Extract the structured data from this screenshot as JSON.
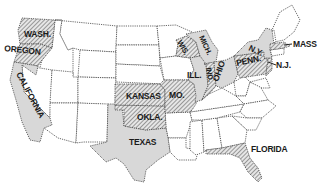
{
  "map": {
    "title": "",
    "legend_styles": {
      "gray": "#d8d8d8",
      "hatch": "diagonal-lines",
      "plain": "#ffffff"
    },
    "labels": {
      "wash": "WASH.",
      "oregon": "OREGON",
      "california": "CALIFORNIA",
      "kansas": "KANSAS",
      "mo": "MO.",
      "okla": "OKLA.",
      "texas": "TEXAS",
      "wis": "WIS.",
      "mich": "MICH.",
      "ill": "ILL.",
      "ind": "IND.",
      "ohio": "OHIO",
      "ny": "N.Y.",
      "penn": "PENN.",
      "mass": "MASS",
      "nj": "N.J.",
      "florida": "FLORIDA"
    },
    "highlighted_states": [
      {
        "name": "Washington",
        "style": "hatch"
      },
      {
        "name": "Oregon",
        "style": "hatch"
      },
      {
        "name": "California",
        "style": "gray"
      },
      {
        "name": "Kansas",
        "style": "hatch"
      },
      {
        "name": "Missouri",
        "style": "hatch"
      },
      {
        "name": "Oklahoma",
        "style": "hatch"
      },
      {
        "name": "Texas",
        "style": "gray"
      },
      {
        "name": "Wisconsin",
        "style": "hatch"
      },
      {
        "name": "Michigan",
        "style": "gray"
      },
      {
        "name": "Illinois",
        "style": "gray"
      },
      {
        "name": "Indiana",
        "style": "hatch"
      },
      {
        "name": "Ohio",
        "style": "gray"
      },
      {
        "name": "New York",
        "style": "gray"
      },
      {
        "name": "Pennsylvania",
        "style": "hatch"
      },
      {
        "name": "Massachusetts",
        "style": "hatch"
      },
      {
        "name": "New Jersey",
        "style": "hatch"
      },
      {
        "name": "Florida",
        "style": "hatch"
      }
    ]
  }
}
